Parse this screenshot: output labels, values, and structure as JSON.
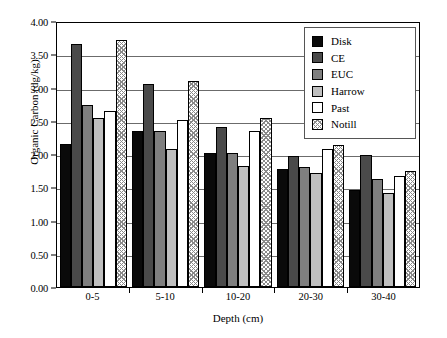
{
  "chart_data": {
    "type": "bar",
    "title": "",
    "xlabel": "Depth (cm)",
    "ylabel": "Organic Carbon (dg/kg)",
    "categories": [
      "0-5",
      "5-10",
      "10-20",
      "20-30",
      "30-40"
    ],
    "ylim": [
      0,
      4.0
    ],
    "ytick_labels": [
      "0.00",
      "0.50",
      "1.00",
      "1.50",
      "2.00",
      "2.50",
      "3.00",
      "3.50",
      "4.00"
    ],
    "ytick_values": [
      0,
      0.5,
      1.0,
      1.5,
      2.0,
      2.5,
      3.0,
      3.5,
      4.0
    ],
    "grid": "horizontal",
    "legend_position": "top-right",
    "series": [
      {
        "name": "Disk",
        "fill": "#0a0a0a",
        "values": [
          2.15,
          2.34,
          2.02,
          1.78,
          1.46
        ]
      },
      {
        "name": "CE",
        "fill": "#4a4a4a",
        "values": [
          3.65,
          3.05,
          2.4,
          1.97,
          1.98
        ]
      },
      {
        "name": "EUC",
        "fill": "#7f7f7f",
        "values": [
          2.73,
          2.34,
          2.01,
          1.8,
          1.63
        ]
      },
      {
        "name": "Harrow",
        "fill": "#bfbfbf",
        "values": [
          2.54,
          2.08,
          1.82,
          1.72,
          1.42
        ]
      },
      {
        "name": "Past",
        "fill": "#ffffff",
        "values": [
          2.64,
          2.51,
          2.34,
          2.08,
          1.67
        ]
      },
      {
        "name": "Notill",
        "fill": "hatch",
        "values": [
          3.71,
          3.1,
          2.54,
          2.14,
          1.74
        ]
      }
    ]
  }
}
